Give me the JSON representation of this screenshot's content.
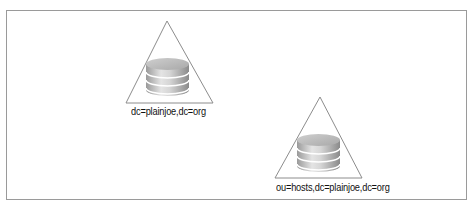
{
  "diagram": {
    "type": "ldap-directory-tree-nodes",
    "colors": {
      "frame_border": "#9a9a9a",
      "triangle_stroke": "#8c8c8c",
      "database_light": "#e6e6e6",
      "database_dark": "#8a8a8a"
    },
    "nodes": [
      {
        "id": "root",
        "icon": "database-icon",
        "shape": "triangle",
        "label": "dc=plainjoe,dc=org"
      },
      {
        "id": "hosts",
        "icon": "database-icon",
        "shape": "triangle",
        "label": "ou=hosts,dc=plainjoe,dc=org"
      }
    ]
  }
}
